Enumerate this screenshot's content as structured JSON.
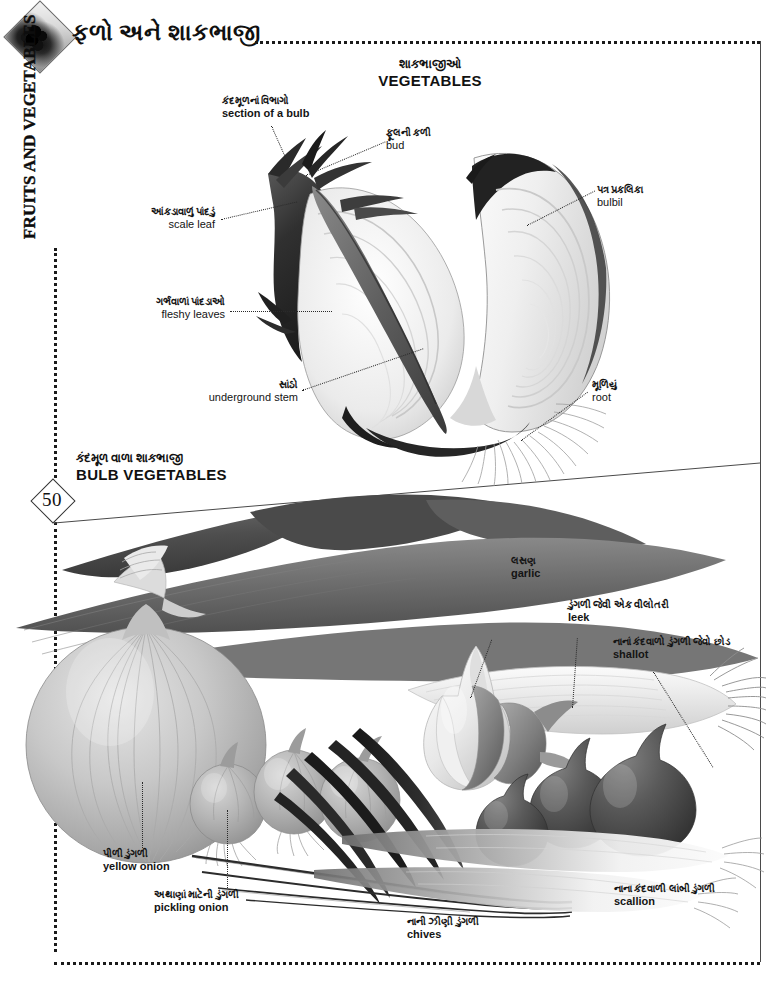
{
  "page": {
    "number": "50",
    "language_primary": "Gujarati",
    "language_secondary": "English"
  },
  "header": {
    "title_gu": "ફળો અને શાકભાજી",
    "title_en": "FRUITS AND VEGETABLES",
    "icon": "diamond-photo-icon"
  },
  "sections": {
    "vegetables": {
      "gu": "શાકભાજીઓ",
      "en": "VEGETABLES"
    },
    "bulb_vegetables": {
      "gu": "કંદમૂળ વાળા શાકભાજી",
      "en": "BULB VEGETABLES"
    }
  },
  "bulb_section": {
    "title_gu": "કંદમૂળનાં વિભાગો",
    "title_en": "section of a bulb",
    "labels": [
      {
        "gu": "ફૂલની કળી",
        "en": "bud"
      },
      {
        "gu": "પત્ર પ્રકલિકા",
        "en": "bulbil"
      },
      {
        "gu": "આંકડાવાળું પાંદડું",
        "en": "scale leaf"
      },
      {
        "gu": "ગર્ભવાળાં પાંદડાઓ",
        "en": "fleshy leaves"
      },
      {
        "gu": "સાંઠો",
        "en": "underground stem"
      },
      {
        "gu": "મૂળિયું",
        "en": "root"
      }
    ]
  },
  "bulb_vegetables": {
    "labels": [
      {
        "gu": "લસણ",
        "en": "garlic"
      },
      {
        "gu": "ડુંગળી જેવી એક વીલોતરી",
        "en": "leek"
      },
      {
        "gu": "નાનાં કંદવાળો ડુંગળી જેવો છોડ",
        "en": "shallot"
      },
      {
        "gu": "પીળી ડુંગળી",
        "en": "yellow onion"
      },
      {
        "gu": "અથાણાં માટેની ડુંગળી",
        "en": "pickling onion"
      },
      {
        "gu": "નાની ઝીણી ડુંગળી",
        "en": "chives"
      },
      {
        "gu": "નાના કંદવાળી લાંબી ડુંગળી",
        "en": "scallion"
      }
    ]
  },
  "colors": {
    "ink": "#141414",
    "rule": "#1a1a1a",
    "paper": "#ffffff"
  }
}
